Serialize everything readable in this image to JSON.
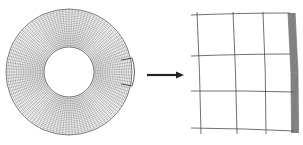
{
  "diagram": {
    "type": "mesh-refinement-illustration",
    "annulus_mesh": {
      "center": [
        69,
        72
      ],
      "outer_radius": 63,
      "inner_radius": 25,
      "radial_rings": 22,
      "angular_divisions": 120,
      "stroke_color": "#555555"
    },
    "detail_box": {
      "description": "highlighted boundary region on outer edge",
      "stroke_color": "#333333"
    },
    "arrow": {
      "from": [
        147,
        75
      ],
      "to": [
        184,
        75
      ],
      "color": "#222222"
    },
    "zoomed_mesh": {
      "description": "enlarged view of boundary cells with refined layers at outer edge",
      "grid_rows": 4,
      "grid_cols": 4,
      "refined_layer_color": "#333333"
    }
  }
}
